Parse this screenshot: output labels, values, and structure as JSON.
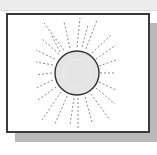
{
  "illustration": {
    "subject": "sun-with-rays",
    "colors": {
      "frame_border": "#3a3a3a",
      "shadow": "#b9b9b9",
      "top_band": "#ececec",
      "sun_fill": "#e4e4e4",
      "sun_outline": "#333333",
      "rays": "#8a8a8a"
    }
  }
}
